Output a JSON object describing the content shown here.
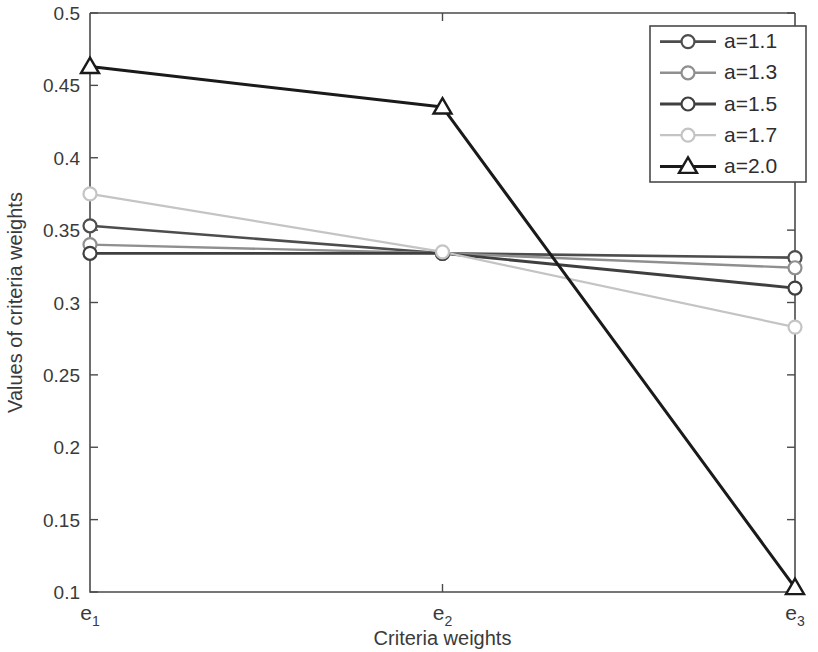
{
  "chart_data": {
    "type": "line",
    "title": "",
    "xlabel": "Criteria weights",
    "ylabel": "Values of criteria weights",
    "categories": [
      "e1",
      "e2",
      "e3"
    ],
    "category_labels": [
      {
        "base": "e",
        "sub": "1"
      },
      {
        "base": "e",
        "sub": "2"
      },
      {
        "base": "e",
        "sub": "3"
      }
    ],
    "ylim": [
      0.1,
      0.5
    ],
    "yticks": [
      0.1,
      0.15,
      0.2,
      0.25,
      0.3,
      0.35,
      0.4,
      0.45,
      0.5
    ],
    "ytick_labels": [
      "0.1",
      "0.15",
      "0.2",
      "0.25",
      "0.3",
      "0.35",
      "0.4",
      "0.45",
      "0.5"
    ],
    "grid": false,
    "legend_position": "top-right",
    "series": [
      {
        "name": "a=1.1",
        "values": [
          0.353,
          0.334,
          0.331
        ],
        "color": "#4d4d4d",
        "marker": "circle",
        "linewidth": 2.6
      },
      {
        "name": "a=1.3",
        "values": [
          0.34,
          0.334,
          0.324
        ],
        "color": "#8f8f8f",
        "marker": "circle",
        "linewidth": 2.4
      },
      {
        "name": "a=1.5",
        "values": [
          0.334,
          0.334,
          0.31
        ],
        "color": "#3f3f3f",
        "marker": "circle",
        "linewidth": 2.8
      },
      {
        "name": "a=1.7",
        "values": [
          0.375,
          0.335,
          0.283
        ],
        "color": "#c4c4c4",
        "marker": "circle",
        "linewidth": 2.2
      },
      {
        "name": "a=2.0",
        "values": [
          0.463,
          0.435,
          0.103
        ],
        "color": "#1a1a1a",
        "marker": "triangle",
        "linewidth": 3.0
      }
    ]
  },
  "legend": {
    "entries": [
      "a=1.1",
      "a=1.3",
      "a=1.5",
      "a=1.7",
      "a=2.0"
    ]
  },
  "axes": {
    "x_title": "Criteria weights",
    "y_title": "Values of criteria weights"
  }
}
